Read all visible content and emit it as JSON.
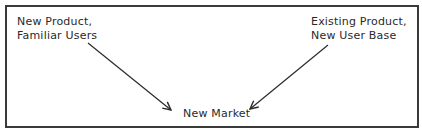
{
  "diagram": {
    "nodes": {
      "top_left": {
        "lines": [
          "New Product,",
          "Familiar Users"
        ]
      },
      "top_right": {
        "lines": [
          "Existing Product,",
          "New User Base"
        ]
      },
      "bottom_center": {
        "label": "New Market"
      }
    },
    "edges": [
      {
        "from": "top_left",
        "to": "bottom_center"
      },
      {
        "from": "top_right",
        "to": "bottom_center"
      }
    ],
    "colors": {
      "stroke": "#2a2a2a",
      "border": "#3a3a3a",
      "background": "#ffffff"
    }
  }
}
